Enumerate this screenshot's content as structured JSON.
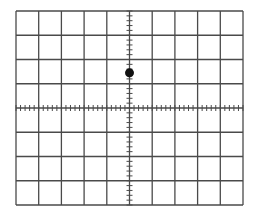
{
  "graticule": {
    "left": 16,
    "top": 11,
    "width": 227,
    "height": 194,
    "columns": 10,
    "rows": 8,
    "minor_ticks_per_division": 5,
    "line_color": "#4a4a4a",
    "tick_color": "#4a4a4a",
    "background": "#ffffff"
  },
  "point": {
    "label": "signal-dot",
    "x_div": 0,
    "y_div": 1.45,
    "radius": 4.5,
    "color": "#111111"
  }
}
